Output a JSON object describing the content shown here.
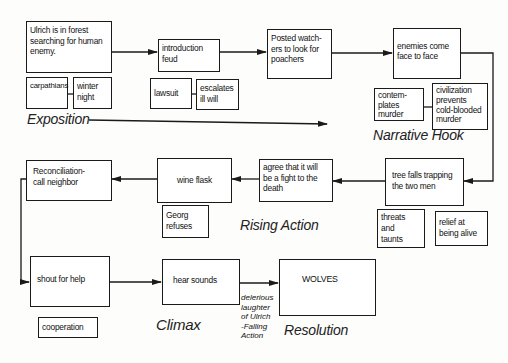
{
  "boxes": {
    "ulrich": "Ulrich is in forest\nsearching for human\nenemy.",
    "carpathians": "carpathians",
    "winter_night": "winter\nnight",
    "introduction": "introduction\n          feud",
    "lawsuit": "lawsuit",
    "escalates": "escalates\nill will",
    "posted": "Posted watch-\ners to look for\npoachers",
    "enemies": "enemies come\nface to face",
    "contemplates": "contem-\nplates\nmurder",
    "civilization": "civilization\nprevents\ncold-blooded\nmurder",
    "reconciliation": "Reconciliation-\ncall neighbor",
    "wine_flask": "wine flask",
    "georg": "Georg\nrefuses",
    "agree": "agree that it will\nbe a fight to the\ndeath",
    "tree_falls": "tree falls trapping\nthe two men",
    "threats": "threats\nand\ntaunts",
    "relief": "relief at\nbeing alive",
    "shout": "shout for help",
    "cooperation": "cooperation",
    "hear_sounds": "hear sounds",
    "wolves": "WOLVES"
  },
  "labels": {
    "exposition": "Exposition",
    "narrative_hook": "Narrative Hook",
    "rising_action": "Rising Action",
    "climax": "Climax",
    "resolution": "Resolution",
    "falling_action_note": "delerious\nlaughter\nof Ulrich\n-Falling\nAction"
  }
}
